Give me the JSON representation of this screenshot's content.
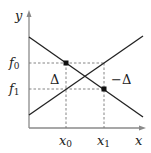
{
  "diagram": {
    "axes": {
      "x_label": "x",
      "y_label": "y",
      "color": "#888888"
    },
    "lines": [
      {
        "name": "decreasing-line",
        "from": [
          29,
          37
        ],
        "to": [
          143,
          117
        ],
        "color": "#222222"
      },
      {
        "name": "increasing-line",
        "from": [
          29,
          115
        ],
        "to": [
          143,
          36
        ],
        "color": "#222222"
      }
    ],
    "points": [
      {
        "name": "point-x0-f0",
        "x": 66,
        "y": 63
      },
      {
        "name": "point-x1-f1",
        "x": 104,
        "y": 89
      }
    ],
    "tick_labels": {
      "f0": {
        "base": "f",
        "sub": "0"
      },
      "f1": {
        "base": "f",
        "sub": "1"
      },
      "x0": {
        "base": "x",
        "sub": "0"
      },
      "x1": {
        "base": "x",
        "sub": "1"
      }
    },
    "annotations": {
      "left_gap": "Δ",
      "right_gap": "−Δ"
    }
  }
}
